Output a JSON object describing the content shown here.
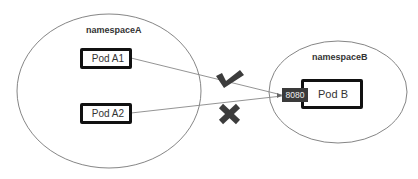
{
  "diagram": {
    "namespaces": [
      {
        "id": "namespaceA",
        "label": "namespaceA"
      },
      {
        "id": "namespaceB",
        "label": "namespaceB"
      }
    ],
    "pods": [
      {
        "id": "podA1",
        "label": "Pod A1",
        "namespace": "namespaceA"
      },
      {
        "id": "podA2",
        "label": "Pod A2",
        "namespace": "namespaceA"
      },
      {
        "id": "podB",
        "label": "Pod B",
        "namespace": "namespaceB"
      }
    ],
    "port": {
      "label": "8080",
      "pod": "podB"
    },
    "connections": [
      {
        "from": "Pod A1",
        "to": "8080",
        "status": "allowed",
        "icon": "check-icon"
      },
      {
        "from": "Pod A2",
        "to": "8080",
        "status": "denied",
        "icon": "cross-icon"
      }
    ],
    "colors": {
      "outline": "#555555",
      "pod_border": "#111111",
      "port_bg": "#3a3a3a",
      "icon": "#3c3c3c"
    }
  }
}
